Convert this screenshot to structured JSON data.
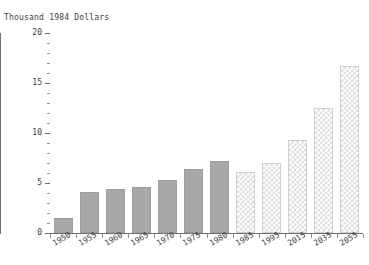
{
  "chart_data": {
    "type": "bar",
    "title": "",
    "ylabel": "Thousand 1984 Dollars",
    "xlabel": "",
    "ylim": [
      0,
      20
    ],
    "yticks": [
      0,
      5,
      10,
      15,
      20
    ],
    "ytick_labels": [
      "0",
      "5",
      "10",
      "15",
      "20"
    ],
    "y_minor_tick_step": 1,
    "grid": false,
    "legend": null,
    "categories": [
      "1950",
      "1955",
      "1960",
      "1965",
      "1970",
      "1975",
      "1980",
      "1985",
      "1995",
      "2015",
      "2035",
      "2055"
    ],
    "values": [
      1.5,
      4.1,
      4.4,
      4.6,
      5.3,
      6.4,
      7.2,
      6.1,
      7.0,
      9.3,
      12.5,
      16.7
    ],
    "bar_styles": [
      "solid",
      "solid",
      "solid",
      "solid",
      "solid",
      "solid",
      "solid",
      "hatched",
      "hatched",
      "hatched",
      "hatched",
      "hatched"
    ],
    "colors": {
      "solid_bar": "#a8a8a8",
      "hatched_bar": "#dcdcdc",
      "axis": "#6f6f6f",
      "text": "#3d3d3d",
      "background": "#ffffff"
    }
  }
}
